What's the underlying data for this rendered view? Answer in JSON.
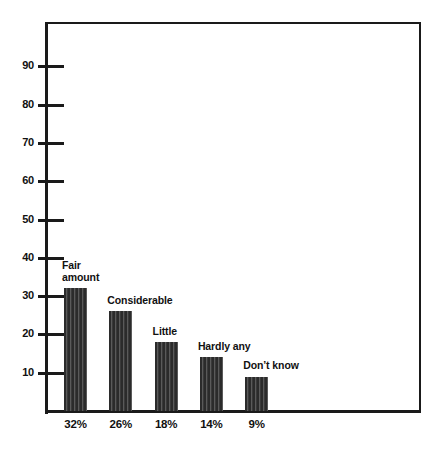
{
  "chart_data": {
    "type": "bar",
    "title": "",
    "subtitle": "",
    "xlabel": "",
    "ylabel": "",
    "grid": false,
    "legend": "none",
    "ylim": [
      0,
      100
    ],
    "yticks": [
      10,
      20,
      30,
      40,
      50,
      60,
      70,
      80,
      90
    ],
    "ytick_labels": [
      "10",
      "20",
      "30",
      "40",
      "50",
      "60",
      "70",
      "80",
      "90"
    ],
    "categories": [
      "Fair amount",
      "Considerable",
      "Little",
      "Hardly any",
      "Don’t know"
    ],
    "values": [
      32,
      26,
      18,
      14,
      9
    ],
    "value_labels": [
      "32%",
      "26%",
      "18%",
      "14%",
      "9%"
    ],
    "bar_labels": [
      "Fair\namount",
      "Considerable",
      "Little",
      "Hardly any",
      "Don’t know"
    ],
    "bar_color": "#343434",
    "axis_color": "#1a1a1a",
    "background": "#ffffff"
  },
  "axis": {
    "ticks": [
      {
        "value": "90"
      },
      {
        "value": "80"
      },
      {
        "value": "70"
      },
      {
        "value": "60"
      },
      {
        "value": "50"
      },
      {
        "value": "40"
      },
      {
        "value": "30"
      },
      {
        "value": "20"
      },
      {
        "value": "10"
      }
    ]
  },
  "bars": [
    {
      "label": "Fair\namount",
      "percent": "32%"
    },
    {
      "label": "Considerable",
      "percent": "26%"
    },
    {
      "label": "Little",
      "percent": "18%"
    },
    {
      "label": "Hardly any",
      "percent": "14%"
    },
    {
      "label": "Don’t know",
      "percent": "9%"
    }
  ]
}
